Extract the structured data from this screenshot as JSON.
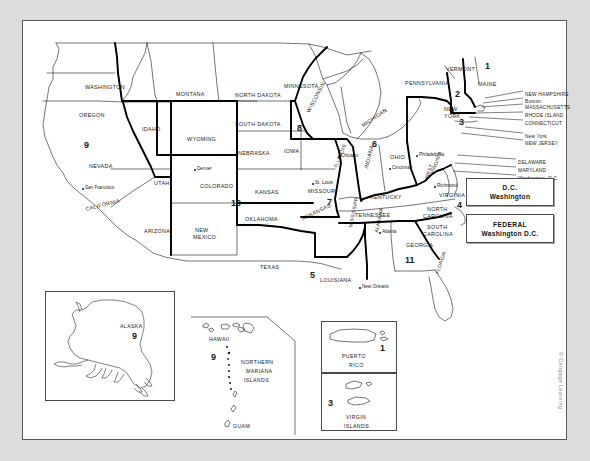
{
  "map": {
    "title": "United States Federal Judicial Circuits Map",
    "credit": "© Cengage Learning"
  },
  "legend": {
    "boxes": [
      {
        "line1": "D.C.",
        "line2": "Washington"
      },
      {
        "line1": "FEDERAL",
        "line2": "Washington D.C."
      }
    ]
  },
  "states": [
    {
      "name": "WASHINGTON",
      "x": 62,
      "y": 64,
      "rot": 0,
      "cls": "state"
    },
    {
      "name": "OREGON",
      "x": 56,
      "y": 92,
      "rot": 0,
      "cls": "state"
    },
    {
      "name": "IDAHO",
      "x": 119,
      "y": 106,
      "rot": 0,
      "cls": "state"
    },
    {
      "name": "MONTANA",
      "x": 153,
      "y": 71,
      "rot": 0,
      "cls": "state"
    },
    {
      "name": "NORTH DAKOTA",
      "x": 212,
      "y": 72,
      "rot": 0,
      "cls": "state"
    },
    {
      "name": "SOUTH DAKOTA",
      "x": 212,
      "y": 101,
      "rot": 0,
      "cls": "state"
    },
    {
      "name": "MINNESOTA",
      "x": 261,
      "y": 63,
      "rot": 0,
      "cls": "state"
    },
    {
      "name": "WYOMING",
      "x": 164,
      "y": 116,
      "rot": 0,
      "cls": "state"
    },
    {
      "name": "NEBRASKA",
      "x": 215,
      "y": 130,
      "rot": 0,
      "cls": "state"
    },
    {
      "name": "IOWA",
      "x": 261,
      "y": 128,
      "rot": 0,
      "cls": "state"
    },
    {
      "name": "WISCONSIN",
      "x": 283,
      "y": 90,
      "rot": -62,
      "cls": "state"
    },
    {
      "name": "MICHIGAN",
      "x": 338,
      "y": 103,
      "rot": -34,
      "cls": "state"
    },
    {
      "name": "ILLINOIS",
      "x": 310,
      "y": 145,
      "rot": -66,
      "cls": "state"
    },
    {
      "name": "INDIANA",
      "x": 341,
      "y": 147,
      "rot": -76,
      "cls": "state"
    },
    {
      "name": "OHIO",
      "x": 367,
      "y": 134,
      "rot": 0,
      "cls": "state"
    },
    {
      "name": "NEVADA",
      "x": 66,
      "y": 143,
      "rot": 0,
      "cls": "state"
    },
    {
      "name": "UTAH",
      "x": 131,
      "y": 160,
      "rot": 0,
      "cls": "state"
    },
    {
      "name": "COLORADO",
      "x": 177,
      "y": 163,
      "rot": 0,
      "cls": "state"
    },
    {
      "name": "KANSAS",
      "x": 232,
      "y": 169,
      "rot": 0,
      "cls": "state"
    },
    {
      "name": "MISSOURI",
      "x": 285,
      "y": 168,
      "rot": 0,
      "cls": "state"
    },
    {
      "name": "CALIFORNIA",
      "x": 62,
      "y": 186,
      "rot": -14,
      "cls": "state"
    },
    {
      "name": "ARIZONA",
      "x": 121,
      "y": 208,
      "rot": 0,
      "cls": "state"
    },
    {
      "name": "NEW",
      "x": 172,
      "y": 207,
      "rot": 0,
      "cls": "state"
    },
    {
      "name": "MEXICO",
      "x": 170,
      "y": 214,
      "rot": 0,
      "cls": "state"
    },
    {
      "name": "OKLAHOMA",
      "x": 222,
      "y": 196,
      "rot": 0,
      "cls": "state"
    },
    {
      "name": "TEXAS",
      "x": 237,
      "y": 244,
      "rot": 0,
      "cls": "state"
    },
    {
      "name": "ARKANSAS",
      "x": 278,
      "y": 196,
      "rot": -26,
      "cls": "state"
    },
    {
      "name": "LOUISIANA",
      "x": 297,
      "y": 257,
      "rot": 0,
      "cls": "state"
    },
    {
      "name": "MISSISSIPPI",
      "x": 325,
      "y": 206,
      "rot": -78,
      "cls": "state2"
    },
    {
      "name": "ALABAMA",
      "x": 351,
      "y": 211,
      "rot": -78,
      "cls": "state2"
    },
    {
      "name": "TENNESSEE",
      "x": 332,
      "y": 192,
      "rot": 0,
      "cls": "state"
    },
    {
      "name": "KENTUCKY",
      "x": 347,
      "y": 174,
      "rot": 0,
      "cls": "state"
    },
    {
      "name": "GEORGIA",
      "x": 383,
      "y": 222,
      "rot": 0,
      "cls": "state"
    },
    {
      "name": "FLORIDA",
      "x": 412,
      "y": 252,
      "rot": -72,
      "cls": "state2"
    },
    {
      "name": "NORTH",
      "x": 404,
      "y": 186,
      "rot": 0,
      "cls": "state"
    },
    {
      "name": "CAROLINA",
      "x": 400,
      "y": 193,
      "rot": 0,
      "cls": "state"
    },
    {
      "name": "SOUTH",
      "x": 404,
      "y": 204,
      "rot": 0,
      "cls": "state"
    },
    {
      "name": "CAROLINA",
      "x": 400,
      "y": 211,
      "rot": 0,
      "cls": "state"
    },
    {
      "name": "VIRGINIA",
      "x": 416,
      "y": 172,
      "rot": 0,
      "cls": "state"
    },
    {
      "name": "WEST",
      "x": 401,
      "y": 157,
      "rot": -70,
      "cls": "state2"
    },
    {
      "name": "VIRGINIA",
      "x": 407,
      "y": 152,
      "rot": -70,
      "cls": "state2"
    },
    {
      "name": "PENNSYLVANIA",
      "x": 382,
      "y": 60,
      "rot": 0,
      "cls": "state"
    },
    {
      "name": "VERMONT",
      "x": 423,
      "y": 46,
      "rot": 0,
      "cls": "state"
    },
    {
      "name": "MAINE",
      "x": 455,
      "y": 61,
      "rot": 0,
      "cls": "state"
    },
    {
      "name": "NEW",
      "x": 421,
      "y": 86,
      "rot": 0,
      "cls": "state"
    },
    {
      "name": "YORK",
      "x": 421,
      "y": 93,
      "rot": 0,
      "cls": "state"
    }
  ],
  "northeast_callouts": [
    {
      "name": "NEW HAMPSHIRE",
      "x": 502,
      "y": 72
    },
    {
      "name": "Boston",
      "x": 502,
      "y": 79,
      "city": true
    },
    {
      "name": "MASSACHUSETTS",
      "x": 502,
      "y": 85
    },
    {
      "name": "RHODE ISLAND",
      "x": 502,
      "y": 93
    },
    {
      "name": "CONNECTICUT",
      "x": 502,
      "y": 101
    },
    {
      "name": "New York",
      "x": 502,
      "y": 114,
      "city": true
    },
    {
      "name": "NEW JERSEY",
      "x": 502,
      "y": 121
    },
    {
      "name": "DELAWARE",
      "x": 495,
      "y": 140
    },
    {
      "name": "MARYLAND",
      "x": 495,
      "y": 148
    },
    {
      "name": "Washington, D.C.",
      "x": 495,
      "y": 156,
      "city": true
    }
  ],
  "cities": [
    {
      "name": "San Francisco",
      "x": 62,
      "y": 165
    },
    {
      "name": "Denver",
      "x": 174,
      "y": 146
    },
    {
      "name": "Chicago",
      "x": 318,
      "y": 133
    },
    {
      "name": "St. Louis",
      "x": 292,
      "y": 160
    },
    {
      "name": "Cincinnati",
      "x": 369,
      "y": 145
    },
    {
      "name": "Philadelphia",
      "x": 396,
      "y": 132
    },
    {
      "name": "Richmond",
      "x": 414,
      "y": 163
    },
    {
      "name": "Atlanta",
      "x": 359,
      "y": 209
    },
    {
      "name": "New Orleans",
      "x": 339,
      "y": 264
    }
  ],
  "circuits": [
    {
      "number": "1",
      "x": 462,
      "y": 41
    },
    {
      "number": "2",
      "x": 432,
      "y": 69
    },
    {
      "number": "3",
      "x": 436,
      "y": 97
    },
    {
      "number": "4",
      "x": 434,
      "y": 180
    },
    {
      "number": "5",
      "x": 287,
      "y": 250
    },
    {
      "number": "6",
      "x": 349,
      "y": 119
    },
    {
      "number": "7",
      "x": 304,
      "y": 177
    },
    {
      "number": "8",
      "x": 274,
      "y": 103
    },
    {
      "number": "9",
      "x": 61,
      "y": 120
    },
    {
      "number": "10",
      "x": 208,
      "y": 178
    },
    {
      "number": "11",
      "x": 382,
      "y": 235
    }
  ],
  "insets": {
    "alaska": {
      "name": "ALASKA",
      "circuit": "9"
    },
    "pacific": {
      "hawaii": "HAWAII",
      "circuit": "9",
      "northern_mariana": [
        "NORTHERN",
        "MARIANA",
        "ISLANDS"
      ],
      "guam": "GUAM"
    },
    "caribbean": {
      "puerto_rico": [
        "PUERTO",
        "RICO"
      ],
      "puerto_rico_circuit": "1",
      "virgin_islands": [
        "VIRGIN",
        "ISLANDS"
      ],
      "virgin_islands_circuit": "3"
    }
  }
}
